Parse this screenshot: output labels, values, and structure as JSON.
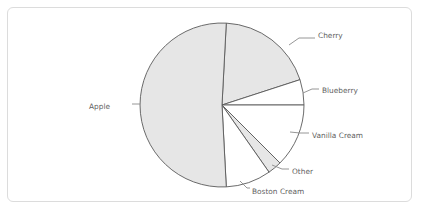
{
  "frame": {
    "border_color": "#dcdcdc",
    "background": "#ffffff"
  },
  "chart_data": {
    "type": "pie",
    "title": "",
    "subtitle": "",
    "xlabel": "",
    "ylabel": "",
    "legend_position": "none",
    "labels_position": "outside-with-leader-lines",
    "grid": false,
    "start_angle_deg": -87,
    "direction": "clockwise",
    "center": {
      "x": 222,
      "y": 105
    },
    "radius": 82,
    "categories": [
      "Cherry",
      "Blueberry",
      "Vanilla Cream",
      "Other",
      "Boston Cream",
      "Apple"
    ],
    "values": [
      19.2,
      5.0,
      12.5,
      2.8,
      8.9,
      51.6
    ],
    "units": "percent",
    "slices": [
      {
        "label": "Cherry",
        "value": 19.2,
        "start_deg": -87,
        "end_deg": -18,
        "fill": "#e6e6e6",
        "stroke": "#5a5a5a",
        "label_x": 318,
        "label_y": 36,
        "leader": "M 289,45 L 299,38 L 315,38"
      },
      {
        "label": "Blueberry",
        "value": 5.0,
        "start_deg": -18,
        "end_deg": 0,
        "fill": "#ffffff",
        "stroke": "#5a5a5a",
        "label_x": 322,
        "label_y": 91,
        "leader": "M 303,93 L 312,89 L 319,89"
      },
      {
        "label": "Vanilla Cream",
        "value": 12.5,
        "start_deg": 0,
        "end_deg": 45,
        "fill": "#ffffff",
        "stroke": "#5a5a5a",
        "label_x": 312,
        "label_y": 136,
        "leader": "M 290,132 L 300,133 L 309,133"
      },
      {
        "label": "Other",
        "value": 2.8,
        "start_deg": 45,
        "end_deg": 55,
        "fill": "#e6e6e6",
        "stroke": "#5a5a5a",
        "label_x": 292,
        "label_y": 172,
        "leader": "M 272,165 L 282,169 L 289,169"
      },
      {
        "label": "Boston Cream",
        "value": 8.9,
        "start_deg": 55,
        "end_deg": 87,
        "fill": "#ffffff",
        "stroke": "#5a5a5a",
        "label_x": 252,
        "label_y": 192,
        "leader": "M 240,181 L 247,188 L 250,188"
      },
      {
        "label": "Apple",
        "value": 51.6,
        "start_deg": 87,
        "end_deg": 273,
        "fill": "#e6e6e6",
        "stroke": "#5a5a5a",
        "label_x": 110,
        "label_y": 107,
        "leader": "M 140,104 L 132,104"
      }
    ]
  }
}
